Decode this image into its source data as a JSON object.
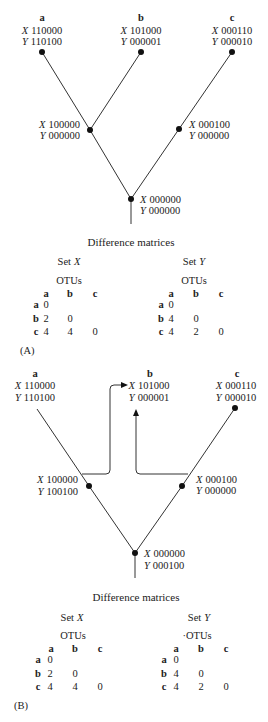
{
  "figure": {
    "variables": {
      "x": "X",
      "y": "Y"
    },
    "panels": {
      "A": {
        "label": "(A)",
        "tips": {
          "a": {
            "name": "a",
            "X": "110000",
            "Y": "110100"
          },
          "b": {
            "name": "b",
            "X": "101000",
            "Y": "000001"
          },
          "c": {
            "name": "c",
            "X": "000110",
            "Y": "000010"
          }
        },
        "node_ab": {
          "X": "100000",
          "Y": "000000"
        },
        "node_c": {
          "X": "000100",
          "Y": "000000"
        },
        "root": {
          "X": "000000",
          "Y": "000000"
        },
        "matrices_title": "Difference matrices",
        "set_x": {
          "title": "Set",
          "var": "X",
          "otus_label": "OTUs",
          "columns": [
            "a",
            "b",
            "c"
          ],
          "rows": [
            {
              "label": "a",
              "values": [
                "0"
              ]
            },
            {
              "label": "b",
              "values": [
                "2",
                "0"
              ]
            },
            {
              "label": "c",
              "values": [
                "4",
                "4",
                "0"
              ]
            }
          ]
        },
        "set_y": {
          "title": "Set",
          "var": "Y",
          "otus_label": "OTUs",
          "columns": [
            "a",
            "b",
            "c"
          ],
          "rows": [
            {
              "label": "a",
              "values": [
                "0"
              ]
            },
            {
              "label": "b",
              "values": [
                "4",
                "0"
              ]
            },
            {
              "label": "c",
              "values": [
                "4",
                "2",
                "0"
              ]
            }
          ]
        }
      },
      "B": {
        "label": "(B)",
        "tips": {
          "a": {
            "name": "a",
            "X": "110000",
            "Y": "110100"
          },
          "b": {
            "name": "b",
            "X": "101000",
            "Y": "000001"
          },
          "c": {
            "name": "c",
            "X": "000110",
            "Y": "000010"
          }
        },
        "node_ab": {
          "X": "100000",
          "Y": "100100"
        },
        "node_c": {
          "X": "000100",
          "Y": "000000"
        },
        "root": {
          "X": "000000",
          "Y": "000100"
        },
        "matrices_title": "Difference matrices",
        "set_x": {
          "title": "Set",
          "var": "X",
          "otus_label": "OTUs",
          "columns": [
            "a",
            "b",
            "c"
          ],
          "rows": [
            {
              "label": "a",
              "values": [
                "0"
              ]
            },
            {
              "label": "b",
              "values": [
                "2",
                "0"
              ]
            },
            {
              "label": "c",
              "values": [
                "4",
                "4",
                "0"
              ]
            }
          ]
        },
        "set_y": {
          "title": "Set",
          "var": "Y",
          "otus_label": "·OTUs",
          "columns": [
            "a",
            "b",
            "c"
          ],
          "rows": [
            {
              "label": "a",
              "values": [
                "0"
              ]
            },
            {
              "label": "b",
              "values": [
                "4",
                "0"
              ]
            },
            {
              "label": "c",
              "values": [
                "4",
                "2",
                "0"
              ]
            }
          ]
        }
      }
    }
  }
}
